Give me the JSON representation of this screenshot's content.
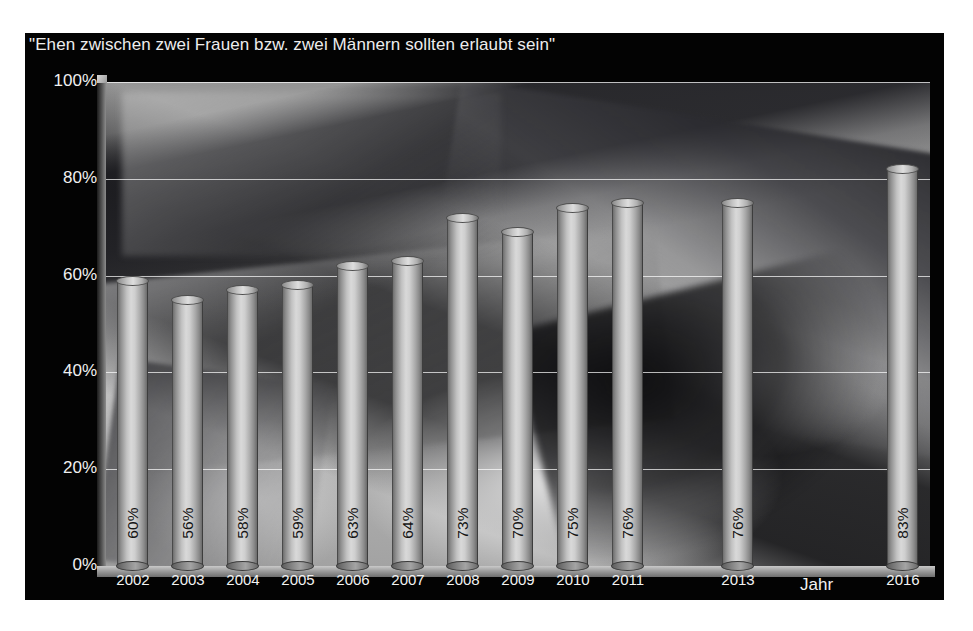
{
  "chart_data": {
    "type": "bar",
    "title": "\"Ehen zwischen zwei Frauen bzw. zwei Männern sollten erlaubt sein\"",
    "xlabel": "Jahr",
    "ylabel": "",
    "ylim": [
      0,
      100
    ],
    "grid": true,
    "legend": "none",
    "categories": [
      "2002",
      "2003",
      "2004",
      "2005",
      "2006",
      "2007",
      "2008",
      "2009",
      "2010",
      "2011",
      "2013",
      "2016"
    ],
    "values": [
      60,
      56,
      58,
      59,
      63,
      64,
      73,
      70,
      75,
      76,
      76,
      83
    ],
    "value_labels": [
      "60%",
      "56%",
      "58%",
      "59%",
      "63%",
      "64%",
      "73%",
      "70%",
      "75%",
      "76%",
      "76%",
      "83%"
    ],
    "ytick_labels": [
      "100%",
      "80%",
      "60%",
      "40%",
      "20%",
      "0%"
    ],
    "ytick_values": [
      100,
      80,
      60,
      40,
      20,
      0
    ]
  },
  "colors": {
    "panel_background": "#030303",
    "axis_text": "#f0f0f0",
    "gridline": "#ffffff",
    "bar_light": "#d9d9d9",
    "bar_dark": "#6b6b6b",
    "value_label": "#151515"
  }
}
